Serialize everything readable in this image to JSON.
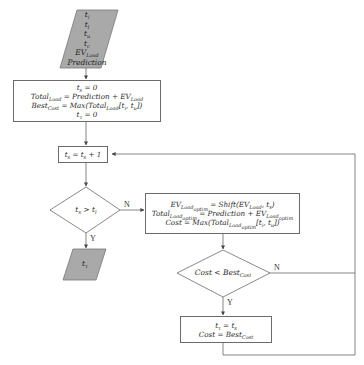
{
  "diagram": {
    "type": "flowchart",
    "colors": {
      "stroke": "#6b6b6b",
      "io_fill": "#a9a9a9",
      "background": "#ffffff"
    },
    "input": {
      "shape": "parallelogram",
      "lines": [
        "t_i",
        "t_l",
        "t_u",
        "t_c",
        "EV_Load",
        "Prediction"
      ],
      "l1": "t",
      "l1s": "i",
      "l2": "t",
      "l2s": "l",
      "l3": "t",
      "l3s": "u",
      "l4": "t",
      "l4s": "c",
      "l5": "EV",
      "l5s": "Load",
      "l6": "Prediction"
    },
    "init": {
      "shape": "rectangle",
      "lines": [
        "t_s = 0",
        "Total_Load = Prediction + EV_Load",
        "Best_Cost = Max(Total_Load[t_i, t_u])",
        "t_τ = 0"
      ],
      "a1": "t",
      "a1s": "s",
      "a1r": " = 0",
      "b1": "Total",
      "b1s": "Load",
      "b1r": " = Prediction + EV",
      "b1s2": "Load",
      "c1": "Best",
      "c1s": "Cost",
      "c1r": " = Max(Total",
      "c1s2": "Load",
      "c1r2": "[t",
      "c1s3": "i",
      "c1r3": ", t",
      "c1s4": "u",
      "c1r4": "])",
      "d1": "t",
      "d1s": "τ",
      "d1r": " = 0"
    },
    "increment": {
      "shape": "rectangle",
      "text": "t_s = t_s + 1",
      "a": "t",
      "as": "s",
      "b": " = t",
      "bs": "s",
      "c": " + 1"
    },
    "decision1": {
      "shape": "diamond",
      "text": "t_s > t_l",
      "a": "t",
      "as": "s",
      "b": " > t",
      "bs": "l",
      "yes_label": "Y",
      "no_label": "N"
    },
    "output": {
      "shape": "parallelogram",
      "text": "t_τ",
      "a": "t",
      "as": "τ"
    },
    "optimize": {
      "shape": "rectangle",
      "lines": [
        "EV_Load_optim = Shift(EV_Load, t_s)",
        "Total_Load_optim = Prediction + EV_Load_optim",
        "Cost = Max(Total_Load_optim[t_i, t_u])"
      ],
      "a": "EV",
      "as": "Load",
      "ass": "optim",
      "ar": " = Shift(EV",
      "as2": "Load",
      "ar2": ", t",
      "as3": "s",
      "ar3": ")",
      "b": "Total",
      "bs": "Load",
      "bss": "optim",
      "br": " = Prediction + EV",
      "bs2": "Load",
      "bss2": "optim",
      "c": "Cost = Max",
      "cr": "(Total",
      "cs": "Load",
      "css": "optim",
      "cr2": "[t",
      "cs2": "i",
      "cr3": ", t",
      "cs3": "u",
      "cr4": "])"
    },
    "decision2": {
      "shape": "diamond",
      "text": "Cost < Best_Cost",
      "a": "Cost < Best",
      "as": "Cost",
      "yes_label": "Y",
      "no_label": "N"
    },
    "update": {
      "shape": "rectangle",
      "lines": [
        "t_τ = t_s",
        "Cost = Best_Cost"
      ],
      "a": "t",
      "as": "τ",
      "ar": " = t",
      "as2": "s",
      "b": "Cost = Best",
      "bs": "Cost"
    }
  }
}
